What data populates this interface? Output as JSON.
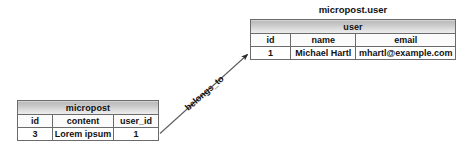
{
  "diagram": {
    "type": "entity-relationship",
    "background": "#ffffff",
    "text_color": "#111111",
    "header_gradient_top": "#b9b9b9",
    "header_gradient_bottom": "#eeeeee",
    "border_color": "#5a5a5a"
  },
  "user_entity": {
    "caption": "micropost.user",
    "title": "user",
    "columns": [
      "id",
      "name",
      "email"
    ],
    "rows": [
      [
        "1",
        "Michael Hartl",
        "mhartl@example.com"
      ]
    ]
  },
  "micropost_entity": {
    "title": "micropost",
    "columns": [
      "id",
      "content",
      "user_id"
    ],
    "rows": [
      [
        "3",
        "Lorem ipsum",
        "1"
      ]
    ]
  },
  "relationship": {
    "label": "belongs_to",
    "from": "micropost",
    "to": "user",
    "arrow_angle_degrees": -41
  }
}
